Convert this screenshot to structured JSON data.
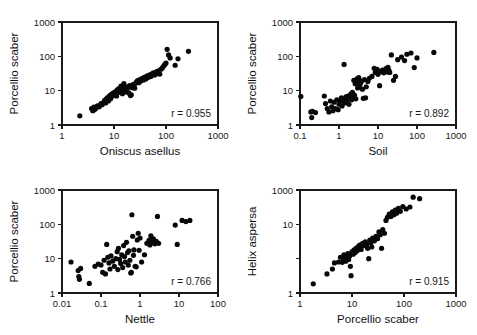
{
  "figure": {
    "type": "scatter-matrix",
    "background": "#ffffff",
    "point_color": "#080808",
    "axis_color": "#1a1a1a",
    "width": 477,
    "height": 335
  },
  "chart_data": [
    {
      "type": "scatter",
      "panel": "top-left",
      "title": "",
      "xlabel": "Oniscus asellus",
      "ylabel": "Porcellio scaber",
      "xscale": "log",
      "yscale": "log",
      "xlim": [
        1,
        1000
      ],
      "ylim": [
        1,
        1000
      ],
      "xticks": [
        1,
        10,
        100,
        1000
      ],
      "xticklabels": [
        "1",
        "10",
        "100",
        "1000"
      ],
      "yticks": [
        1,
        10,
        100,
        1000
      ],
      "yticklabels": [
        "1",
        "10",
        "100",
        "1000"
      ],
      "grid": false,
      "annotation": "r = 0.955",
      "r": 0.955,
      "points": [
        [
          2.2,
          1.85
        ],
        [
          3.7,
          3.0
        ],
        [
          3.9,
          2.6
        ],
        [
          4.1,
          3.3
        ],
        [
          4.2,
          2.8
        ],
        [
          4.5,
          3.1
        ],
        [
          4.8,
          3.6
        ],
        [
          5.2,
          3.4
        ],
        [
          5.6,
          4.2
        ],
        [
          5.9,
          3.9
        ],
        [
          6.3,
          4.6
        ],
        [
          6.6,
          5.2
        ],
        [
          6.9,
          4.4
        ],
        [
          7.1,
          5.6
        ],
        [
          7.4,
          6.2
        ],
        [
          7.8,
          5.0
        ],
        [
          8.0,
          6.6
        ],
        [
          8.3,
          7.2
        ],
        [
          8.6,
          5.8
        ],
        [
          8.9,
          7.8
        ],
        [
          9.2,
          6.9
        ],
        [
          9.5,
          8.4
        ],
        [
          9.8,
          7.4
        ],
        [
          10.2,
          9.0
        ],
        [
          10.5,
          8.0
        ],
        [
          10.9,
          9.6
        ],
        [
          11.2,
          7.0
        ],
        [
          11.6,
          10.5
        ],
        [
          12.0,
          8.8
        ],
        [
          12.4,
          11.5
        ],
        [
          12.8,
          9.4
        ],
        [
          13.2,
          10.0
        ],
        [
          13.6,
          13.5
        ],
        [
          14.0,
          11.0
        ],
        [
          14.5,
          8.2
        ],
        [
          15.0,
          12.0
        ],
        [
          15.5,
          16.0
        ],
        [
          16.0,
          10.8
        ],
        [
          16.6,
          9.2
        ],
        [
          17.2,
          12.6
        ],
        [
          17.8,
          11.2
        ],
        [
          18.5,
          13.0
        ],
        [
          19.2,
          8.6
        ],
        [
          20.0,
          14.0
        ],
        [
          20.8,
          7.2
        ],
        [
          21.5,
          7.6
        ],
        [
          22.3,
          12.2
        ],
        [
          23.2,
          15.0
        ],
        [
          24.0,
          13.4
        ],
        [
          25.0,
          11.8
        ],
        [
          26.0,
          16.5
        ],
        [
          27.2,
          18.0
        ],
        [
          28.5,
          19.5
        ],
        [
          30.0,
          17.0
        ],
        [
          31.5,
          21.0
        ],
        [
          33.0,
          19.0
        ],
        [
          35.0,
          23.0
        ],
        [
          37.0,
          20.5
        ],
        [
          39.0,
          25.0
        ],
        [
          41.0,
          22.0
        ],
        [
          43.5,
          27.0
        ],
        [
          46.0,
          24.5
        ],
        [
          48.5,
          29.0
        ],
        [
          51.0,
          26.0
        ],
        [
          54.0,
          31.0
        ],
        [
          57.0,
          33.0
        ],
        [
          60.0,
          28.5
        ],
        [
          63.0,
          30.0
        ],
        [
          66.0,
          36.0
        ],
        [
          69.0,
          32.0
        ],
        [
          72.0,
          38.0
        ],
        [
          76.0,
          30.5
        ],
        [
          80.0,
          42.0
        ],
        [
          85.0,
          46.0
        ],
        [
          90.0,
          52.0
        ],
        [
          95.0,
          58.0
        ],
        [
          100.0,
          64.0
        ],
        [
          105.0,
          160.0
        ],
        [
          112.0,
          110.0
        ],
        [
          120.0,
          90.0
        ],
        [
          150.0,
          55.0
        ],
        [
          170.0,
          85.0
        ],
        [
          270.0,
          140.0
        ]
      ]
    },
    {
      "type": "scatter",
      "panel": "top-right",
      "title": "",
      "xlabel": "Soil",
      "ylabel": "Porcellio scaber",
      "xscale": "log",
      "yscale": "log",
      "xlim": [
        0.1,
        1000
      ],
      "ylim": [
        1,
        1000
      ],
      "xticks": [
        0.1,
        1,
        10,
        100,
        1000
      ],
      "xticklabels": [
        "0.1",
        "1",
        "10",
        "100",
        "1000"
      ],
      "yticks": [
        1,
        10,
        100,
        1000
      ],
      "yticklabels": [
        "1",
        "10",
        "100",
        "1000"
      ],
      "grid": false,
      "annotation": "r = 0.892",
      "r": 0.892,
      "points": [
        [
          0.105,
          6.8
        ],
        [
          0.19,
          2.4
        ],
        [
          0.2,
          1.65
        ],
        [
          0.21,
          2.5
        ],
        [
          0.25,
          2.3
        ],
        [
          0.42,
          7.0
        ],
        [
          0.45,
          4.2
        ],
        [
          0.5,
          3.0
        ],
        [
          0.55,
          2.4
        ],
        [
          0.6,
          5.0
        ],
        [
          0.65,
          3.4
        ],
        [
          0.7,
          2.6
        ],
        [
          0.75,
          4.6
        ],
        [
          0.8,
          3.0
        ],
        [
          0.88,
          5.4
        ],
        [
          0.95,
          2.8
        ],
        [
          1.0,
          4.0
        ],
        [
          1.1,
          5.0
        ],
        [
          1.15,
          6.2
        ],
        [
          1.2,
          3.6
        ],
        [
          1.3,
          5.6
        ],
        [
          1.35,
          58.0
        ],
        [
          1.4,
          4.4
        ],
        [
          1.5,
          6.6
        ],
        [
          1.6,
          5.2
        ],
        [
          1.7,
          7.0
        ],
        [
          1.8,
          4.0
        ],
        [
          1.9,
          6.0
        ],
        [
          2.0,
          8.0
        ],
        [
          2.1,
          5.4
        ],
        [
          2.2,
          9.0
        ],
        [
          2.3,
          6.4
        ],
        [
          2.4,
          20.0
        ],
        [
          2.5,
          7.4
        ],
        [
          2.6,
          16.0
        ],
        [
          2.7,
          5.8
        ],
        [
          2.8,
          18.0
        ],
        [
          2.9,
          22.0
        ],
        [
          3.0,
          12.0
        ],
        [
          3.2,
          24.0
        ],
        [
          3.4,
          14.0
        ],
        [
          3.6,
          17.0
        ],
        [
          3.8,
          19.0
        ],
        [
          4.0,
          11.0
        ],
        [
          4.2,
          6.0
        ],
        [
          4.5,
          21.0
        ],
        [
          4.8,
          6.2
        ],
        [
          5.0,
          13.0
        ],
        [
          5.5,
          18.5
        ],
        [
          6.0,
          23.0
        ],
        [
          7.0,
          26.0
        ],
        [
          8.0,
          45.0
        ],
        [
          8.5,
          34.0
        ],
        [
          9.0,
          38.0
        ],
        [
          9.5,
          42.0
        ],
        [
          10.0,
          30.0
        ],
        [
          11.0,
          14.0
        ],
        [
          12.0,
          36.0
        ],
        [
          13.0,
          40.0
        ],
        [
          14.0,
          33.0
        ],
        [
          15.0,
          37.0
        ],
        [
          16.0,
          44.0
        ],
        [
          17.0,
          35.0
        ],
        [
          18.0,
          48.0
        ],
        [
          19.0,
          39.0
        ],
        [
          20.0,
          34.0
        ],
        [
          22.0,
          110.0
        ],
        [
          25.0,
          20.0
        ],
        [
          28.0,
          26.0
        ],
        [
          32.0,
          80.0
        ],
        [
          40.0,
          95.0
        ],
        [
          48.0,
          75.0
        ],
        [
          55.0,
          115.0
        ],
        [
          70.0,
          125.0
        ],
        [
          85.0,
          47.0
        ],
        [
          100.0,
          90.0
        ],
        [
          270.0,
          130.0
        ]
      ]
    },
    {
      "type": "scatter",
      "panel": "bottom-left",
      "title": "",
      "xlabel": "Nettle",
      "ylabel": "Porcellio scaber",
      "xscale": "log",
      "yscale": "log",
      "xlim": [
        0.01,
        100
      ],
      "ylim": [
        1,
        1000
      ],
      "xticks": [
        0.01,
        0.1,
        1,
        10,
        100
      ],
      "xticklabels": [
        "0.01",
        "0.1",
        "1",
        "10",
        "100"
      ],
      "yticks": [
        1,
        10,
        100,
        1000
      ],
      "yticklabels": [
        "1",
        "10",
        "100",
        "1000"
      ],
      "grid": false,
      "annotation": "r = 0.766",
      "r": 0.766,
      "points": [
        [
          0.017,
          8.0
        ],
        [
          0.026,
          4.5
        ],
        [
          0.027,
          3.0
        ],
        [
          0.028,
          2.5
        ],
        [
          0.03,
          5.2
        ],
        [
          0.05,
          1.9
        ],
        [
          0.07,
          6.0
        ],
        [
          0.085,
          7.0
        ],
        [
          0.1,
          6.5
        ],
        [
          0.11,
          4.0
        ],
        [
          0.12,
          9.0
        ],
        [
          0.13,
          3.6
        ],
        [
          0.14,
          26.0
        ],
        [
          0.15,
          11.0
        ],
        [
          0.16,
          7.5
        ],
        [
          0.17,
          5.0
        ],
        [
          0.18,
          12.0
        ],
        [
          0.2,
          8.5
        ],
        [
          0.22,
          6.0
        ],
        [
          0.24,
          10.0
        ],
        [
          0.26,
          16.0
        ],
        [
          0.27,
          4.8
        ],
        [
          0.28,
          20.0
        ],
        [
          0.3,
          9.5
        ],
        [
          0.32,
          7.2
        ],
        [
          0.34,
          13.0
        ],
        [
          0.36,
          5.5
        ],
        [
          0.38,
          24.0
        ],
        [
          0.4,
          11.5
        ],
        [
          0.42,
          8.0
        ],
        [
          0.45,
          30.0
        ],
        [
          0.48,
          15.0
        ],
        [
          0.5,
          6.5
        ],
        [
          0.52,
          17.0
        ],
        [
          0.55,
          9.0
        ],
        [
          0.58,
          3.8
        ],
        [
          0.6,
          4.0
        ],
        [
          0.62,
          190.0
        ],
        [
          0.65,
          45.0
        ],
        [
          0.68,
          12.5
        ],
        [
          0.7,
          18.0
        ],
        [
          0.75,
          6.0
        ],
        [
          0.8,
          5.8
        ],
        [
          0.85,
          35.0
        ],
        [
          0.9,
          55.0
        ],
        [
          0.95,
          17.5
        ],
        [
          1.0,
          40.0
        ],
        [
          1.1,
          8.0
        ],
        [
          1.3,
          13.0
        ],
        [
          1.5,
          28.0
        ],
        [
          1.7,
          34.0
        ],
        [
          1.8,
          25.0
        ],
        [
          1.9,
          46.0
        ],
        [
          2.0,
          30.0
        ],
        [
          2.2,
          38.0
        ],
        [
          2.4,
          27.0
        ],
        [
          2.6,
          32.0
        ],
        [
          2.8,
          170.0
        ],
        [
          3.0,
          28.0
        ],
        [
          8.0,
          95.0
        ],
        [
          9.0,
          26.0
        ],
        [
          12.0,
          130.0
        ],
        [
          15.0,
          120.0
        ],
        [
          19.0,
          130.0
        ]
      ]
    },
    {
      "type": "scatter",
      "panel": "bottom-right",
      "title": "",
      "xlabel": "Porcellio scaber",
      "ylabel": "Helix aspersa",
      "xscale": "log",
      "yscale": "log",
      "xlim": [
        1,
        1000
      ],
      "ylim": [
        1,
        1000
      ],
      "xticks": [
        1,
        10,
        100,
        1000
      ],
      "xticklabels": [
        "1",
        "10",
        "100",
        "1000"
      ],
      "yticks": [
        1,
        10,
        100,
        1000
      ],
      "yticklabels": [
        "1",
        "",
        "10",
        "1000"
      ],
      "grid": false,
      "annotation": "r = 0.915",
      "r": 0.915,
      "points": [
        [
          1.8,
          1.85
        ],
        [
          3.3,
          3.6
        ],
        [
          4.2,
          5.0
        ],
        [
          4.6,
          7.5
        ],
        [
          5.5,
          8.0
        ],
        [
          6.0,
          11.0
        ],
        [
          6.5,
          7.8
        ],
        [
          6.8,
          9.0
        ],
        [
          7.0,
          13.0
        ],
        [
          7.3,
          10.0
        ],
        [
          7.6,
          8.4
        ],
        [
          8.0,
          11.5
        ],
        [
          8.3,
          14.0
        ],
        [
          8.6,
          9.5
        ],
        [
          9.0,
          12.0
        ],
        [
          9.3,
          6.0
        ],
        [
          9.6,
          3.2
        ],
        [
          10.0,
          16.0
        ],
        [
          10.5,
          13.5
        ],
        [
          11.0,
          18.0
        ],
        [
          11.5,
          15.0
        ],
        [
          12.0,
          20.0
        ],
        [
          12.5,
          17.0
        ],
        [
          13.0,
          22.0
        ],
        [
          13.5,
          19.0
        ],
        [
          14.0,
          25.0
        ],
        [
          14.5,
          21.0
        ],
        [
          15.0,
          18.5
        ],
        [
          16.0,
          28.0
        ],
        [
          17.0,
          24.0
        ],
        [
          18.0,
          31.0
        ],
        [
          19.0,
          26.0
        ],
        [
          20.0,
          20.0
        ],
        [
          21.0,
          10.0
        ],
        [
          22.0,
          35.0
        ],
        [
          23.0,
          29.0
        ],
        [
          24.0,
          22.0
        ],
        [
          25.0,
          40.0
        ],
        [
          27.0,
          33.0
        ],
        [
          29.0,
          45.0
        ],
        [
          31.0,
          38.0
        ],
        [
          33.0,
          60.0
        ],
        [
          35.0,
          50.0
        ],
        [
          37.0,
          20.0
        ],
        [
          39.0,
          70.0
        ],
        [
          42.0,
          55.0
        ],
        [
          45.0,
          130.0
        ],
        [
          48.0,
          160.0
        ],
        [
          52.0,
          200.0
        ],
        [
          56.0,
          170.0
        ],
        [
          60.0,
          230.0
        ],
        [
          64.0,
          190.0
        ],
        [
          68.0,
          260.0
        ],
        [
          72.0,
          210.0
        ],
        [
          78.0,
          290.0
        ],
        [
          85.0,
          240.0
        ],
        [
          95.0,
          330.0
        ],
        [
          110.0,
          280.0
        ],
        [
          130.0,
          320.0
        ],
        [
          150.0,
          620.0
        ],
        [
          200.0,
          560.0
        ]
      ]
    }
  ]
}
